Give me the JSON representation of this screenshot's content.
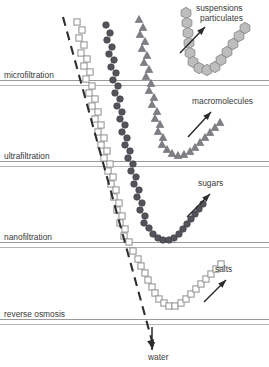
{
  "figure": {
    "width": 269,
    "height": 367,
    "background": "#ffffff"
  },
  "membrane_labels": [
    {
      "id": "microfiltration",
      "text": "microfiltration",
      "x": 4,
      "y": 78,
      "line_y1": 80.5,
      "line_y2": 85.5
    },
    {
      "id": "ultrafiltration",
      "text": "ultrafiltration",
      "x": 4,
      "y": 159,
      "line_y1": 161.5,
      "line_y2": 166.5
    },
    {
      "id": "nanofiltration",
      "text": "nanofiltration",
      "x": 4,
      "y": 240,
      "line_y1": 242.5,
      "line_y2": 247.5
    },
    {
      "id": "reverse-osmosis",
      "text": "reverse osmosis",
      "x": 4,
      "y": 317,
      "line_y1": 319.5,
      "line_y2": 324.5
    }
  ],
  "callouts": [
    {
      "id": "suspensions-particulates",
      "line1": "suspensions",
      "line2": "particulates",
      "x": 196,
      "y1": 11,
      "y2": 21,
      "arrow": {
        "x1": 180,
        "y1": 53,
        "x2": 205,
        "y2": 27
      }
    },
    {
      "id": "macromolecules",
      "line1": "macromolecules",
      "line2": "",
      "x": 192,
      "y1": 104,
      "y2": 0,
      "arrow": {
        "x1": 188,
        "y1": 137,
        "x2": 211,
        "y2": 112
      }
    },
    {
      "id": "sugars",
      "line1": "sugars",
      "line2": "",
      "x": 198,
      "y1": 186,
      "y2": 0,
      "arrow": {
        "x1": 187,
        "y1": 217,
        "x2": 210,
        "y2": 194
      }
    },
    {
      "id": "salts",
      "line1": "salts",
      "line2": "",
      "x": 215,
      "y1": 272,
      "y2": 0,
      "arrow": {
        "x1": 204,
        "y1": 302,
        "x2": 226,
        "y2": 280
      }
    },
    {
      "id": "water",
      "line1": "water",
      "line2": "",
      "x": 148,
      "y1": 360,
      "y2": 0,
      "arrow": {
        "x1": 152,
        "y1": 327,
        "x2": 152,
        "y2": 350
      }
    }
  ],
  "dashed_cutoff": {
    "id": "cutoff-line",
    "x1": 63,
    "y1": 17,
    "x2": 152,
    "y2": 341,
    "arrow_tip_x": 153,
    "arrow_tip_y": 349
  },
  "marker_colors": {
    "square_fill": "#ffffff",
    "square_stroke": "#8e8e8e",
    "circle_fill": "#53535b",
    "triangle_fill": "#7e7e84",
    "hexagon_fill": "#bdbdbd",
    "hexagon_stroke": "#8e8e8e",
    "membrane_line": "#9a9a9a",
    "dash_line": "#2f2f2f",
    "text": "#3a3a3a"
  },
  "chart_data": {
    "type": "scatter",
    "xlabel": "",
    "ylabel": "",
    "grid": false,
    "legend": "none",
    "series": [
      {
        "name": "water",
        "marker": "square",
        "label": "water",
        "points": [
          [
            77,
            22
          ],
          [
            82,
            30
          ],
          [
            79,
            38
          ],
          [
            84,
            45
          ],
          [
            81,
            53
          ],
          [
            87,
            59
          ],
          [
            84,
            66
          ],
          [
            90,
            72
          ],
          [
            86,
            79
          ],
          [
            92,
            86
          ],
          [
            89,
            93
          ],
          [
            95,
            99
          ],
          [
            92,
            106
          ],
          [
            98,
            112
          ],
          [
            95,
            119
          ],
          [
            101,
            125
          ],
          [
            98,
            132
          ],
          [
            104,
            138
          ],
          [
            101,
            145
          ],
          [
            107,
            151
          ],
          [
            104,
            158
          ],
          [
            110,
            164
          ],
          [
            108,
            171
          ],
          [
            113,
            177
          ],
          [
            111,
            184
          ],
          [
            116,
            190
          ],
          [
            114,
            197
          ],
          [
            119,
            203
          ],
          [
            117,
            210
          ],
          [
            122,
            216
          ],
          [
            120,
            223
          ],
          [
            125,
            229
          ],
          [
            124,
            236
          ],
          [
            129,
            242
          ],
          [
            133,
            251
          ],
          [
            138,
            259
          ],
          [
            141,
            266
          ],
          [
            145,
            273
          ],
          [
            148,
            280
          ],
          [
            152,
            287
          ],
          [
            155,
            293
          ],
          [
            159,
            299
          ],
          [
            164,
            303
          ],
          [
            169,
            306
          ],
          [
            175,
            306
          ],
          [
            181,
            303
          ],
          [
            186,
            299
          ],
          [
            191,
            294
          ],
          [
            196,
            289
          ],
          [
            201,
            284
          ],
          [
            206,
            279
          ],
          [
            211,
            274
          ],
          [
            216,
            269
          ],
          [
            221,
            264
          ]
        ]
      },
      {
        "name": "salts",
        "marker": "square",
        "label": "salts",
        "points": []
      },
      {
        "name": "sugars",
        "marker": "circle",
        "label": "sugars",
        "points": [
          [
            106,
            25
          ],
          [
            110,
            33
          ],
          [
            107,
            40
          ],
          [
            112,
            47
          ],
          [
            109,
            54
          ],
          [
            114,
            60
          ],
          [
            111,
            67
          ],
          [
            116,
            73
          ],
          [
            113,
            80
          ],
          [
            118,
            86
          ],
          [
            115,
            93
          ],
          [
            120,
            99
          ],
          [
            117,
            106
          ],
          [
            122,
            112
          ],
          [
            120,
            119
          ],
          [
            125,
            125
          ],
          [
            122,
            132
          ],
          [
            127,
            138
          ],
          [
            125,
            145
          ],
          [
            130,
            151
          ],
          [
            128,
            158
          ],
          [
            133,
            164
          ],
          [
            131,
            171
          ],
          [
            136,
            177
          ],
          [
            134,
            184
          ],
          [
            139,
            190
          ],
          [
            137,
            197
          ],
          [
            142,
            203
          ],
          [
            140,
            210
          ],
          [
            145,
            216
          ],
          [
            144,
            223
          ],
          [
            149,
            228
          ],
          [
            153,
            234
          ],
          [
            158,
            238
          ],
          [
            163,
            240
          ],
          [
            169,
            240
          ],
          [
            174,
            238
          ],
          [
            179,
            234
          ],
          [
            183,
            229
          ],
          [
            187,
            224
          ],
          [
            191,
            219
          ],
          [
            195,
            214
          ],
          [
            199,
            209
          ],
          [
            203,
            204
          ]
        ]
      },
      {
        "name": "macromolecules",
        "marker": "triangle",
        "label": "macromolecules",
        "points": [
          [
            139,
            19
          ],
          [
            143,
            27
          ],
          [
            140,
            34
          ],
          [
            145,
            41
          ],
          [
            142,
            48
          ],
          [
            147,
            55
          ],
          [
            144,
            62
          ],
          [
            149,
            69
          ],
          [
            146,
            76
          ],
          [
            151,
            83
          ],
          [
            149,
            90
          ],
          [
            154,
            97
          ],
          [
            152,
            104
          ],
          [
            157,
            111
          ],
          [
            155,
            118
          ],
          [
            160,
            124
          ],
          [
            158,
            131
          ],
          [
            163,
            137
          ],
          [
            162,
            144
          ],
          [
            167,
            149
          ],
          [
            172,
            153
          ],
          [
            178,
            155
          ],
          [
            184,
            154
          ],
          [
            190,
            151
          ],
          [
            195,
            147
          ],
          [
            200,
            142
          ],
          [
            205,
            137
          ],
          [
            210,
            132
          ],
          [
            215,
            127
          ],
          [
            220,
            122
          ]
        ]
      },
      {
        "name": "suspensions particulates",
        "marker": "hexagon",
        "label": "suspensions / particulates",
        "points": [
          [
            186,
            13
          ],
          [
            187,
            23
          ],
          [
            188,
            33
          ],
          [
            189,
            43
          ],
          [
            190,
            53
          ],
          [
            193,
            62
          ],
          [
            199,
            68
          ],
          [
            207,
            70
          ],
          [
            215,
            67
          ],
          [
            221,
            60
          ],
          [
            227,
            52
          ],
          [
            233,
            44
          ],
          [
            239,
            36
          ],
          [
            245,
            28
          ]
        ]
      }
    ]
  }
}
